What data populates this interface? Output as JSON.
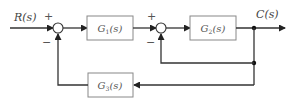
{
  "diagram": {
    "type": "block-diagram",
    "input_label": "R(s)",
    "output_label": "C(s)",
    "summing_junctions": [
      {
        "id": "sum1",
        "plus_sign": "+",
        "minus_sign": "−"
      },
      {
        "id": "sum2",
        "plus_sign": "+",
        "minus_sign": "−"
      }
    ],
    "blocks": [
      {
        "id": "G1",
        "name": "G",
        "sub": "1",
        "arg": "(s)"
      },
      {
        "id": "G2",
        "name": "G",
        "sub": "2",
        "arg": "(s)"
      },
      {
        "id": "G3",
        "name": "G",
        "sub": "3",
        "arg": "(s)"
      }
    ],
    "colors": {
      "line": "#333333",
      "block_border": "#888888",
      "text": "#555555"
    }
  }
}
